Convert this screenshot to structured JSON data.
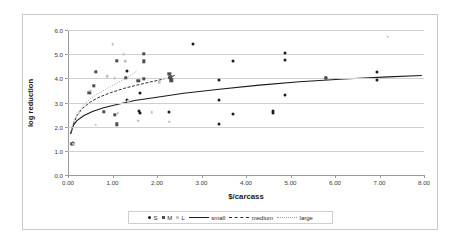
{
  "chart_data": {
    "type": "scatter",
    "title": "",
    "xlabel": "$/carcass",
    "ylabel": "log reduction",
    "xlim": [
      0,
      8
    ],
    "ylim": [
      0,
      6
    ],
    "grid": true,
    "legend_position": "bottom",
    "xticks": [
      "0.00",
      "1.00",
      "2.00",
      "3.00",
      "4.00",
      "5.00",
      "6.00",
      "7.00",
      "8.00"
    ],
    "yticks": [
      "0.0",
      "1.0",
      "2.0",
      "3.0",
      "4.0",
      "5.0",
      "6.0"
    ],
    "series": [
      {
        "name": "S",
        "marker": "filled-circle",
        "color": "#1a1a1a",
        "points": [
          [
            0.1,
            1.3
          ],
          [
            0.12,
            1.32
          ],
          [
            1.32,
            4.32
          ],
          [
            1.62,
            3.38
          ],
          [
            1.6,
            2.63
          ],
          [
            1.62,
            2.58
          ],
          [
            1.32,
            3.1
          ],
          [
            2.28,
            2.6
          ],
          [
            2.8,
            5.42
          ],
          [
            3.4,
            3.92
          ],
          [
            3.4,
            3.1
          ],
          [
            3.4,
            2.12
          ],
          [
            3.7,
            4.72
          ],
          [
            3.7,
            2.53
          ],
          [
            4.6,
            2.66
          ],
          [
            4.6,
            2.58
          ],
          [
            4.88,
            5.03
          ],
          [
            4.88,
            4.75
          ],
          [
            4.88,
            3.32
          ],
          [
            5.8,
            4.02
          ],
          [
            6.95,
            4.25
          ],
          [
            6.95,
            3.93
          ]
        ]
      },
      {
        "name": "M",
        "marker": "filled-square",
        "color": "#4d4d4d",
        "points": [
          [
            0.1,
            1.3
          ],
          [
            0.48,
            3.4
          ],
          [
            0.58,
            3.7
          ],
          [
            0.62,
            4.28
          ],
          [
            0.8,
            2.62
          ],
          [
            1.05,
            2.5
          ],
          [
            1.1,
            2.1
          ],
          [
            1.1,
            4.72
          ],
          [
            1.3,
            4.02
          ],
          [
            1.58,
            3.9
          ],
          [
            1.7,
            5.02
          ],
          [
            1.7,
            4.7
          ],
          [
            1.7,
            3.98
          ],
          [
            2.28,
            4.18
          ],
          [
            2.3,
            4.05
          ],
          [
            2.32,
            3.92
          ],
          [
            5.8,
            4.02
          ]
        ]
      },
      {
        "name": "L",
        "marker": "small-circle",
        "color": "#c2c2c2",
        "points": [
          [
            0.08,
            1.95
          ],
          [
            0.12,
            1.3
          ],
          [
            0.5,
            3.48
          ],
          [
            0.62,
            2.08
          ],
          [
            0.88,
            4.1
          ],
          [
            1.0,
            5.42
          ],
          [
            1.05,
            4.0
          ],
          [
            1.12,
            2.55
          ],
          [
            1.25,
            5.0
          ],
          [
            1.28,
            4.7
          ],
          [
            1.35,
            3.05
          ],
          [
            1.58,
            2.25
          ],
          [
            1.88,
            2.6
          ],
          [
            2.05,
            3.85
          ],
          [
            2.28,
            2.2
          ],
          [
            7.18,
            5.72
          ]
        ]
      }
    ],
    "fitted_curves": [
      {
        "name": "small",
        "style": "solid",
        "color": "#1a1a1a",
        "points": [
          [
            0.06,
            1.7
          ],
          [
            0.12,
            2.05
          ],
          [
            0.2,
            2.25
          ],
          [
            0.35,
            2.45
          ],
          [
            0.55,
            2.63
          ],
          [
            0.8,
            2.78
          ],
          [
            1.1,
            2.92
          ],
          [
            1.5,
            3.08
          ],
          [
            2.0,
            3.22
          ],
          [
            2.6,
            3.38
          ],
          [
            3.4,
            3.55
          ],
          [
            4.3,
            3.72
          ],
          [
            5.2,
            3.86
          ],
          [
            6.2,
            3.97
          ],
          [
            7.2,
            4.06
          ],
          [
            7.95,
            4.12
          ]
        ]
      },
      {
        "name": "medium",
        "style": "dashed",
        "color": "#2f2f2f",
        "points": [
          [
            0.06,
            1.72
          ],
          [
            0.12,
            2.1
          ],
          [
            0.2,
            2.45
          ],
          [
            0.32,
            2.75
          ],
          [
            0.5,
            3.02
          ],
          [
            0.7,
            3.22
          ],
          [
            0.95,
            3.4
          ],
          [
            1.25,
            3.58
          ],
          [
            1.55,
            3.72
          ],
          [
            1.85,
            3.85
          ],
          [
            2.1,
            3.95
          ],
          [
            2.3,
            4.05
          ],
          [
            2.4,
            4.12
          ]
        ]
      },
      {
        "name": "large",
        "style": "dotted",
        "color": "#9e9e9e",
        "points": [
          [
            0.06,
            1.78
          ],
          [
            0.12,
            2.18
          ],
          [
            0.22,
            2.58
          ],
          [
            0.36,
            2.92
          ],
          [
            0.52,
            3.18
          ],
          [
            0.72,
            3.42
          ],
          [
            0.95,
            3.65
          ],
          [
            1.15,
            3.85
          ],
          [
            1.32,
            4.02
          ],
          [
            1.45,
            4.18
          ],
          [
            1.55,
            4.32
          ]
        ]
      }
    ],
    "legend": [
      {
        "label": "S",
        "type": "marker-s"
      },
      {
        "label": "M",
        "type": "marker-m"
      },
      {
        "label": "L",
        "type": "marker-l"
      },
      {
        "label": "small",
        "type": "line-solid"
      },
      {
        "label": "medium",
        "type": "line-dashed"
      },
      {
        "label": "large",
        "type": "line-dotted"
      }
    ]
  }
}
